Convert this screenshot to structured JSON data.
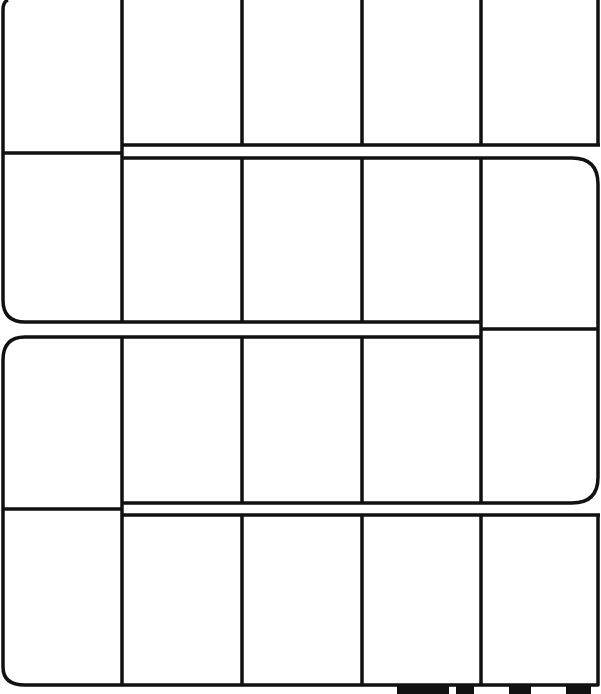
{
  "board": {
    "type": "serpentine-track",
    "rows": 4,
    "columns": 5,
    "colors": {
      "line": "#111111",
      "background": "#ffffff"
    },
    "cells": [
      {
        "row": 1,
        "col": 1
      },
      {
        "row": 1,
        "col": 2
      },
      {
        "row": 1,
        "col": 3
      },
      {
        "row": 1,
        "col": 4
      },
      {
        "row": 1,
        "col": 5
      },
      {
        "row": 2,
        "col": 1
      },
      {
        "row": 2,
        "col": 2
      },
      {
        "row": 2,
        "col": 3
      },
      {
        "row": 2,
        "col": 4
      },
      {
        "row": 2,
        "col": 5
      },
      {
        "row": 3,
        "col": 1
      },
      {
        "row": 3,
        "col": 2
      },
      {
        "row": 3,
        "col": 3
      },
      {
        "row": 3,
        "col": 4
      },
      {
        "row": 3,
        "col": 5
      },
      {
        "row": 4,
        "col": 1
      },
      {
        "row": 4,
        "col": 2
      },
      {
        "row": 4,
        "col": 3
      },
      {
        "row": 4,
        "col": 4
      },
      {
        "row": 4,
        "col": 5
      }
    ]
  }
}
